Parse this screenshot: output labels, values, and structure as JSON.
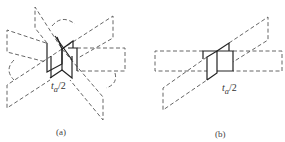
{
  "figure": {
    "panels": [
      {
        "id": "a",
        "caption": "(a)",
        "dimension_label": {
          "var": "t",
          "sub": "a",
          "rest": "/2"
        }
      },
      {
        "id": "b",
        "caption": "(b)",
        "dimension_label": {
          "var": "t",
          "sub": "a",
          "rest": "/2"
        }
      }
    ],
    "colors": {
      "dashed": "#555555",
      "solid": "#222222",
      "background": "#ffffff"
    }
  }
}
